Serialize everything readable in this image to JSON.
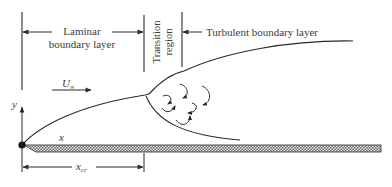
{
  "diagram": {
    "regions": {
      "laminar": {
        "line1": "Laminar",
        "line2": "boundary layer"
      },
      "transition": {
        "line1": "Transition",
        "line2": "region"
      },
      "turbulent": {
        "label": "Turbulent boundary layer"
      }
    },
    "symbols": {
      "freestream_velocity": "U",
      "freestream_subscript": "∞",
      "y_axis": "y",
      "x_axis": "x",
      "critical_length": "x",
      "critical_subscript": "cr"
    },
    "colors": {
      "line": "#2a2a2a",
      "text": "#3a3a3a",
      "plate_fill": "#bdbdbd"
    }
  }
}
